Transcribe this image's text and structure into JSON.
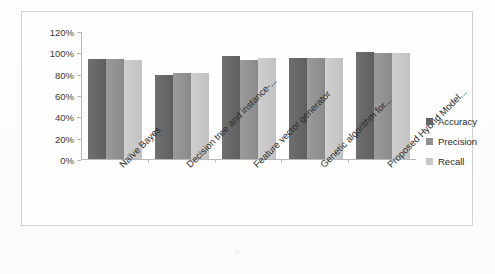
{
  "chart_data": {
    "type": "bar",
    "title": "",
    "subtitle": "",
    "xlabel": "",
    "ylabel": "",
    "ylim": [
      0,
      120
    ],
    "grid": false,
    "legend_position": "right",
    "y_tick_labels": [
      "120%",
      "100%",
      "80%",
      "60%",
      "40%",
      "20%",
      "0%"
    ],
    "y_tick_values": [
      120,
      100,
      80,
      60,
      40,
      20,
      0
    ],
    "categories": [
      "Naïve Bayes",
      "Decision tree and instance-...",
      "Feature vector generator",
      "Genetic algorithm for...",
      "Proposed Hybrid Model..."
    ],
    "series": [
      {
        "name": "Accuracy",
        "color": "#666666",
        "values": [
          94,
          79,
          97,
          95,
          100
        ]
      },
      {
        "name": "Precision",
        "color": "#919191",
        "values": [
          94,
          81,
          93,
          95,
          99
        ]
      },
      {
        "name": "Recall",
        "color": "#c6c6c6",
        "values": [
          93,
          81,
          95,
          95,
          99
        ]
      }
    ]
  },
  "legend": {
    "items": [
      {
        "label": "Accuracy"
      },
      {
        "label": "Precision"
      },
      {
        "label": "Recall"
      }
    ]
  }
}
